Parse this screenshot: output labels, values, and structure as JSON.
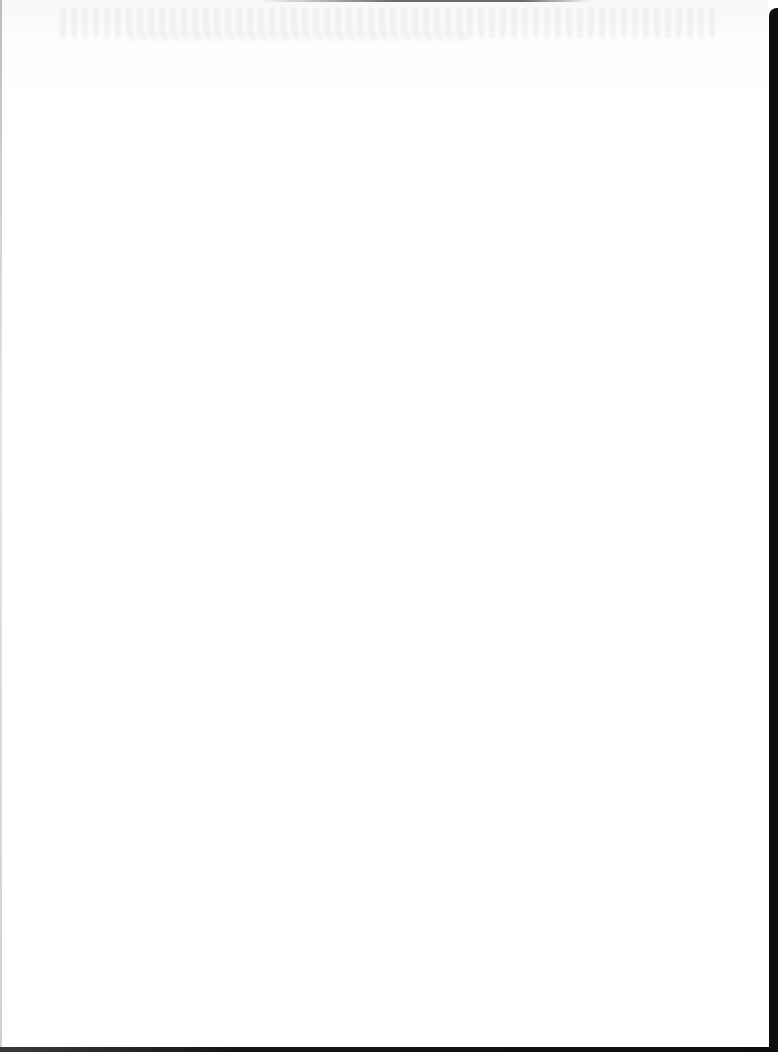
{
  "document": {
    "type": "scanned-page",
    "content": "",
    "colors": {
      "paper": "#ffffff",
      "scan_edge": "#0d0d0d"
    }
  }
}
